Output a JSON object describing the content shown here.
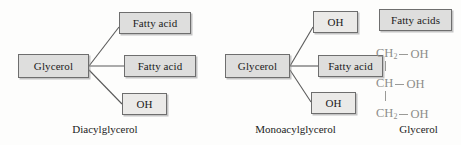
{
  "figure": {
    "background": "#fdfdfc",
    "box_fill": "#dededd",
    "box_border": "#6e6e6e",
    "line_color": "#5a5a5a",
    "structure_color": "#8d8d8a"
  },
  "panels": [
    {
      "id": "diacylglycerol",
      "caption": "Diacylglycerol",
      "center": {
        "label": "Glycerol"
      },
      "branches": [
        {
          "label": "Fatty acid",
          "position": "top"
        },
        {
          "label": "Fatty acid",
          "position": "middle"
        },
        {
          "label": "OH",
          "position": "bottom"
        }
      ]
    },
    {
      "id": "monoacylglycerol",
      "caption": "Monoacylglycerol",
      "center": {
        "label": "Glycerol"
      },
      "branches": [
        {
          "label": "OH",
          "position": "top"
        },
        {
          "label": "Fatty acid",
          "position": "middle"
        },
        {
          "label": "OH",
          "position": "bottom"
        }
      ]
    },
    {
      "id": "glycerol-structure",
      "caption": "Glycerol",
      "header": {
        "label": "Fatty acids"
      },
      "structure": {
        "rows": [
          {
            "carbon": "CH",
            "subscript": "2",
            "bond": "—",
            "group": "OH",
            "vertical_bond_below": true
          },
          {
            "carbon": "CH",
            "subscript": "",
            "bond": "—",
            "group": "OH",
            "vertical_bond_below": true
          },
          {
            "carbon": "CH",
            "subscript": "2",
            "bond": "—",
            "group": "OH",
            "vertical_bond_below": false
          }
        ]
      }
    }
  ]
}
